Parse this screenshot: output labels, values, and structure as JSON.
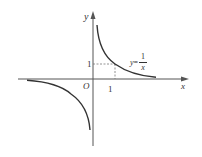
{
  "diagram": {
    "function_label": {
      "lhs": "y",
      "equals": "=",
      "numerator": "1",
      "denominator": "x"
    },
    "axes": {
      "x_label": "x",
      "y_label": "y",
      "origin_label": "O"
    },
    "ticks": {
      "x_tick_label": "1",
      "y_tick_label": "1"
    },
    "colors": {
      "curve": "#333333",
      "axis": "#555555",
      "dashed": "#777777",
      "background": "#ffffff"
    },
    "curve_branches": [
      {
        "name": "first-quadrant-branch",
        "x_range": [
          0.18,
          2.9
        ]
      },
      {
        "name": "third-quadrant-branch",
        "x_range": [
          -3.0,
          -0.12
        ]
      }
    ],
    "reference_point": {
      "x": 1,
      "y": 1
    }
  }
}
